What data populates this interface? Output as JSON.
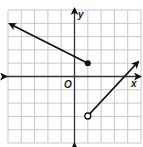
{
  "graph": {
    "axis_labels": {
      "x": "x",
      "y": "y",
      "origin": "O"
    },
    "grid": {
      "x_min": -5,
      "x_max": 5,
      "y_min": -5,
      "y_max": 5,
      "step": 1
    },
    "colors": {
      "grid": "#c8c8c8",
      "axis": "#333333",
      "line": "#111111"
    },
    "pieces": [
      {
        "name": "left-ray",
        "from": [
          1,
          1
        ],
        "to": [
          -5,
          4
        ],
        "slope": -0.5,
        "endpoint": "closed",
        "arrow_at": [
          -5,
          4
        ]
      },
      {
        "name": "right-ray",
        "from": [
          1,
          -3
        ],
        "to": [
          5,
          1
        ],
        "slope": 1,
        "endpoint": "open",
        "arrow_at": [
          5,
          1
        ]
      }
    ]
  }
}
